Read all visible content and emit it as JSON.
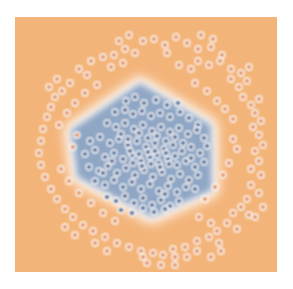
{
  "figure": {
    "title": "",
    "background_color": "#ffffff",
    "plot_left": 15,
    "plot_top": 17,
    "plot_width": 262,
    "plot_height": 255
  },
  "chart_data": {
    "type": "scatter",
    "title": "",
    "subtitle": "",
    "xlabel": "",
    "ylabel": "",
    "xlim": [
      0,
      262
    ],
    "ylim": [
      0,
      255
    ],
    "grid": false,
    "legend": null,
    "legend_position": "none",
    "axes_visible": false,
    "tick_labels_x": [],
    "tick_labels_y": [],
    "colors": {
      "region_class0": "#8fa6c4",
      "region_class1": "#f3b47a",
      "boundary_glow": "#ffffff",
      "point_class0_fill": "#3d5f92",
      "point_class0_edge": "#ffffff",
      "point_class1_fill": "#e08e52",
      "point_class1_edge": "#ffffff",
      "figure_background": "#ffffff"
    },
    "point_radius": 3.0,
    "point_edge_width": 1.3,
    "decision_boundary_polygon": [
      [
        125,
        66
      ],
      [
        196,
        108
      ],
      [
        197,
        173
      ],
      [
        137,
        200
      ],
      [
        62,
        160
      ],
      [
        56,
        113
      ]
    ],
    "series": [
      {
        "name": "class0",
        "label": "Class 0 (inside boundary)",
        "color": "#3d5f92",
        "marker": "o",
        "count": 118,
        "points": [
          [
            111,
            84
          ],
          [
            120,
            80
          ],
          [
            129,
            86
          ],
          [
            141,
            83
          ],
          [
            152,
            88
          ],
          [
            163,
            86
          ],
          [
            100,
            95
          ],
          [
            110,
            93
          ],
          [
            118,
            97
          ],
          [
            127,
            94
          ],
          [
            136,
            99
          ],
          [
            145,
            96
          ],
          [
            155,
            100
          ],
          [
            165,
            95
          ],
          [
            174,
            101
          ],
          [
            183,
            108
          ],
          [
            92,
            106
          ],
          [
            101,
            110
          ],
          [
            110,
            106
          ],
          [
            119,
            112
          ],
          [
            128,
            108
          ],
          [
            137,
            114
          ],
          [
            146,
            110
          ],
          [
            155,
            115
          ],
          [
            164,
            111
          ],
          [
            173,
            117
          ],
          [
            182,
            113
          ],
          [
            189,
            121
          ],
          [
            75,
            124
          ],
          [
            85,
            120
          ],
          [
            95,
            126
          ],
          [
            104,
            122
          ],
          [
            113,
            128
          ],
          [
            122,
            124
          ],
          [
            131,
            130
          ],
          [
            140,
            126
          ],
          [
            149,
            132
          ],
          [
            158,
            128
          ],
          [
            167,
            134
          ],
          [
            176,
            130
          ],
          [
            185,
            136
          ],
          [
            192,
            129
          ],
          [
            70,
            137
          ],
          [
            80,
            133
          ],
          [
            90,
            140
          ],
          [
            99,
            136
          ],
          [
            108,
            142
          ],
          [
            117,
            138
          ],
          [
            126,
            144
          ],
          [
            135,
            140
          ],
          [
            144,
            146
          ],
          [
            153,
            142
          ],
          [
            162,
            148
          ],
          [
            171,
            144
          ],
          [
            180,
            150
          ],
          [
            189,
            145
          ],
          [
            74,
            150
          ],
          [
            84,
            154
          ],
          [
            93,
            149
          ],
          [
            102,
            156
          ],
          [
            111,
            151
          ],
          [
            120,
            158
          ],
          [
            129,
            153
          ],
          [
            138,
            160
          ],
          [
            147,
            155
          ],
          [
            156,
            162
          ],
          [
            165,
            157
          ],
          [
            174,
            163
          ],
          [
            183,
            158
          ],
          [
            80,
            164
          ],
          [
            90,
            168
          ],
          [
            99,
            163
          ],
          [
            108,
            170
          ],
          [
            117,
            165
          ],
          [
            126,
            172
          ],
          [
            135,
            167
          ],
          [
            144,
            174
          ],
          [
            153,
            169
          ],
          [
            162,
            175
          ],
          [
            171,
            170
          ],
          [
            180,
            172
          ],
          [
            92,
            180
          ],
          [
            101,
            184
          ],
          [
            110,
            179
          ],
          [
            119,
            186
          ],
          [
            128,
            181
          ],
          [
            137,
            188
          ],
          [
            146,
            183
          ],
          [
            155,
            189
          ],
          [
            164,
            184
          ],
          [
            106,
            193
          ],
          [
            117,
            196
          ],
          [
            128,
            191
          ],
          [
            139,
            195
          ],
          [
            150,
            192
          ],
          [
            124,
            116
          ],
          [
            133,
            121
          ],
          [
            142,
            119
          ],
          [
            151,
            124
          ],
          [
            160,
            120
          ],
          [
            115,
            134
          ],
          [
            124,
            137
          ],
          [
            133,
            135
          ],
          [
            142,
            138
          ],
          [
            151,
            136
          ],
          [
            118,
            146
          ],
          [
            127,
            149
          ],
          [
            136,
            147
          ],
          [
            145,
            150
          ],
          [
            154,
            147
          ],
          [
            106,
            117
          ],
          [
            113,
            122
          ],
          [
            160,
            139
          ],
          [
            168,
            126
          ],
          [
            176,
            141
          ],
          [
            97,
            144
          ],
          [
            88,
            156
          ],
          [
            150,
            177
          ],
          [
            140,
            134
          ]
        ]
      },
      {
        "name": "class1",
        "label": "Class 1 (outside boundary)",
        "color": "#e08e52",
        "marker": "o",
        "count": 122,
        "points": [
          [
            128,
            24
          ],
          [
            139,
            22
          ],
          [
            150,
            28
          ],
          [
            161,
            20
          ],
          [
            172,
            26
          ],
          [
            183,
            32
          ],
          [
            110,
            32
          ],
          [
            99,
            38
          ],
          [
            196,
            30
          ],
          [
            207,
            38
          ],
          [
            76,
            44
          ],
          [
            88,
            40
          ],
          [
            183,
            44
          ],
          [
            194,
            48
          ],
          [
            205,
            44
          ],
          [
            216,
            52
          ],
          [
            64,
            52
          ],
          [
            72,
            58
          ],
          [
            120,
            36
          ],
          [
            152,
            36
          ],
          [
            55,
            66
          ],
          [
            47,
            74
          ],
          [
            216,
            62
          ],
          [
            224,
            70
          ],
          [
            232,
            64
          ],
          [
            40,
            80
          ],
          [
            36,
            90
          ],
          [
            228,
            80
          ],
          [
            236,
            88
          ],
          [
            244,
            82
          ],
          [
            32,
            100
          ],
          [
            28,
            112
          ],
          [
            240,
            96
          ],
          [
            246,
            104
          ],
          [
            238,
            110
          ],
          [
            26,
            124
          ],
          [
            24,
            136
          ],
          [
            244,
            118
          ],
          [
            248,
            128
          ],
          [
            240,
            134
          ],
          [
            26,
            148
          ],
          [
            30,
            160
          ],
          [
            244,
            144
          ],
          [
            236,
            152
          ],
          [
            246,
            158
          ],
          [
            36,
            172
          ],
          [
            42,
            182
          ],
          [
            236,
            168
          ],
          [
            244,
            176
          ],
          [
            232,
            182
          ],
          [
            50,
            192
          ],
          [
            58,
            200
          ],
          [
            226,
            190
          ],
          [
            234,
            198
          ],
          [
            218,
            196
          ],
          [
            68,
            208
          ],
          [
            78,
            214
          ],
          [
            212,
            206
          ],
          [
            222,
            212
          ],
          [
            202,
            214
          ],
          [
            90,
            220
          ],
          [
            102,
            226
          ],
          [
            194,
            220
          ],
          [
            204,
            226
          ],
          [
            182,
            224
          ],
          [
            114,
            230
          ],
          [
            126,
            234
          ],
          [
            170,
            230
          ],
          [
            182,
            234
          ],
          [
            158,
            232
          ],
          [
            138,
            236
          ],
          [
            148,
            238
          ],
          [
            160,
            240
          ],
          [
            128,
            240
          ],
          [
            172,
            240
          ],
          [
            44,
            108
          ],
          [
            52,
            96
          ],
          [
            60,
            86
          ],
          [
            70,
            76
          ],
          [
            82,
            68
          ],
          [
            218,
            102
          ],
          [
            210,
            92
          ],
          [
            202,
            84
          ],
          [
            192,
            74
          ],
          [
            180,
            66
          ],
          [
            46,
            152
          ],
          [
            54,
            164
          ],
          [
            64,
            176
          ],
          [
            76,
            186
          ],
          [
            214,
            146
          ],
          [
            208,
            158
          ],
          [
            200,
            170
          ],
          [
            190,
            182
          ],
          [
            96,
            50
          ],
          [
            108,
            46
          ],
          [
            164,
            48
          ],
          [
            176,
            52
          ],
          [
            88,
            196
          ],
          [
            100,
            204
          ],
          [
            184,
            200
          ],
          [
            196,
            206
          ],
          [
            62,
            118
          ],
          [
            58,
            130
          ],
          [
            218,
            122
          ],
          [
            222,
            132
          ],
          [
            114,
            18
          ],
          [
            104,
            24
          ],
          [
            186,
            18
          ],
          [
            198,
            22
          ],
          [
            42,
            62
          ],
          [
            34,
            70
          ],
          [
            226,
            56
          ],
          [
            234,
            50
          ],
          [
            80,
            226
          ],
          [
            92,
            234
          ],
          [
            206,
            234
          ],
          [
            196,
            240
          ],
          [
            146,
            248
          ],
          [
            132,
            246
          ],
          [
            160,
            248
          ],
          [
            50,
            210
          ],
          [
            60,
            218
          ],
          [
            240,
            200
          ],
          [
            248,
            190
          ]
        ]
      }
    ]
  }
}
